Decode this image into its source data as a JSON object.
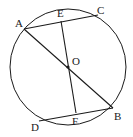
{
  "diagram": {
    "type": "geometry-circle",
    "circle": {
      "center": "O",
      "cx": 68,
      "cy": 67,
      "r": 58
    },
    "stroke_color": "#1a1a1a",
    "points": {
      "A": {
        "label": "A",
        "x": 24,
        "y": 29
      },
      "C": {
        "label": "C",
        "x": 98,
        "y": 15
      },
      "E": {
        "label": "E",
        "x": 61,
        "y": 21
      },
      "O": {
        "label": "O",
        "x": 68,
        "y": 67
      },
      "B": {
        "label": "B",
        "x": 113,
        "y": 108
      },
      "D": {
        "label": "D",
        "x": 39,
        "y": 121
      },
      "F": {
        "label": "F",
        "x": 76,
        "y": 113
      }
    },
    "segments": [
      {
        "from": "A",
        "to": "C",
        "name": "chord-AC"
      },
      {
        "from": "A",
        "to": "B",
        "name": "diameter-AB"
      },
      {
        "from": "D",
        "to": "B",
        "name": "chord-DB"
      },
      {
        "from": "E",
        "to": "F",
        "name": "segment-EF"
      }
    ]
  }
}
